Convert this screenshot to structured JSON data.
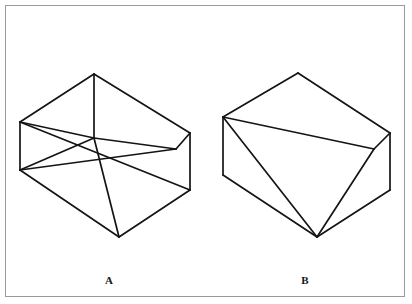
{
  "page": {
    "background_color": "#ffffff",
    "frame_color": "#9a9a9a",
    "ink_color": "#141414"
  },
  "figures": [
    {
      "id": "figure-a",
      "label": "A",
      "label_position": {
        "x": 109,
        "y": 280
      },
      "description": "Wireframe block with pyramidal notch, hidden edges shown",
      "style": "transparent-wireframe",
      "vertices": {
        "top_apex": {
          "x": 94,
          "y": 74
        },
        "upper_left": {
          "x": 20,
          "y": 122
        },
        "lower_left": {
          "x": 20,
          "y": 170
        },
        "upper_right": {
          "x": 190,
          "y": 133
        },
        "lower_right": {
          "x": 190,
          "y": 190
        },
        "center": {
          "x": 94,
          "y": 138
        },
        "bottom_apex": {
          "x": 119,
          "y": 237
        },
        "right_mid": {
          "x": 176,
          "y": 149
        }
      },
      "edges": [
        [
          "upper_left",
          "top_apex"
        ],
        [
          "top_apex",
          "upper_right"
        ],
        [
          "upper_left",
          "lower_left"
        ],
        [
          "upper_right",
          "lower_right"
        ],
        [
          "lower_left",
          "bottom_apex"
        ],
        [
          "bottom_apex",
          "lower_right"
        ],
        [
          "top_apex",
          "center"
        ],
        [
          "upper_left",
          "center"
        ],
        [
          "center",
          "right_mid"
        ],
        [
          "right_mid",
          "upper_right"
        ],
        [
          "center",
          "bottom_apex"
        ],
        [
          "upper_left",
          "lower_right"
        ],
        [
          "lower_left",
          "right_mid"
        ],
        [
          "lower_left",
          "center"
        ]
      ]
    },
    {
      "id": "figure-b",
      "label": "B",
      "label_position": {
        "x": 305,
        "y": 280
      },
      "description": "Solid block with pyramidal notch, hidden edges removed",
      "style": "solid-visible-edges",
      "vertices": {
        "top_apex": {
          "x": 298,
          "y": 73
        },
        "upper_left": {
          "x": 223,
          "y": 117
        },
        "lower_left": {
          "x": 223,
          "y": 175
        },
        "upper_right": {
          "x": 390,
          "y": 133
        },
        "lower_right": {
          "x": 390,
          "y": 190
        },
        "right_mid": {
          "x": 374,
          "y": 149
        },
        "bottom_apex": {
          "x": 317,
          "y": 237
        }
      },
      "edges": [
        [
          "upper_left",
          "top_apex"
        ],
        [
          "top_apex",
          "upper_right"
        ],
        [
          "upper_left",
          "lower_left"
        ],
        [
          "upper_right",
          "lower_right"
        ],
        [
          "lower_left",
          "bottom_apex"
        ],
        [
          "bottom_apex",
          "lower_right"
        ],
        [
          "upper_left",
          "right_mid"
        ],
        [
          "right_mid",
          "upper_right"
        ],
        [
          "upper_left",
          "bottom_apex"
        ],
        [
          "right_mid",
          "bottom_apex"
        ]
      ]
    }
  ]
}
